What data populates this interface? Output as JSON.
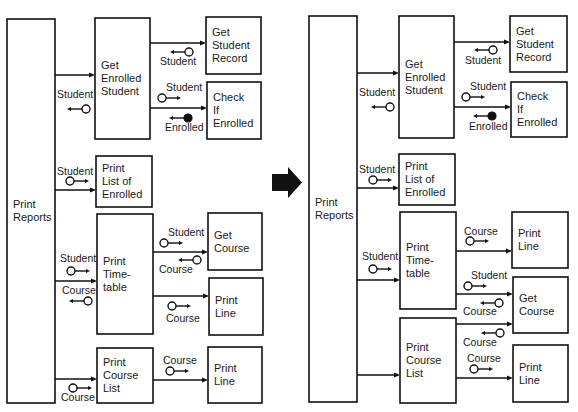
{
  "colors": {
    "ink": "#111111",
    "background": "#ffffff",
    "transform_arrow": "#111111"
  },
  "transform_arrow": {
    "icon": "right-arrow-icon",
    "meaning": "transforms-into"
  },
  "before": {
    "modules": [
      {
        "id": "print-reports",
        "lines": [
          "Print",
          "Reports"
        ],
        "x": 7,
        "y": 19,
        "w": 48,
        "h": 384
      },
      {
        "id": "get-enrolled-student",
        "lines": [
          "Get",
          "Enrolled",
          "Student"
        ],
        "x": 95,
        "y": 18,
        "w": 55,
        "h": 121
      },
      {
        "id": "get-student-record",
        "lines": [
          "Get",
          "Student",
          "Record"
        ],
        "x": 206,
        "y": 17,
        "w": 55,
        "h": 57
      },
      {
        "id": "check-if-enrolled",
        "lines": [
          "Check",
          "If",
          "Enrolled"
        ],
        "x": 207,
        "y": 82,
        "w": 54,
        "h": 57
      },
      {
        "id": "print-list-of-enrolled",
        "lines": [
          "Print",
          "List of",
          "Enrolled"
        ],
        "x": 96,
        "y": 156,
        "w": 56,
        "h": 51
      },
      {
        "id": "print-timetable",
        "lines": [
          "Print",
          "Time-",
          "table"
        ],
        "x": 97,
        "y": 214,
        "w": 56,
        "h": 120
      },
      {
        "id": "get-course",
        "lines": [
          "Get",
          "Course"
        ],
        "x": 208,
        "y": 213,
        "w": 54,
        "h": 57
      },
      {
        "id": "print-line-a",
        "lines": [
          "Print",
          "Line"
        ],
        "x": 209,
        "y": 278,
        "w": 54,
        "h": 57
      },
      {
        "id": "print-course-list",
        "lines": [
          "Print",
          "Course",
          "List"
        ],
        "x": 97,
        "y": 348,
        "w": 56,
        "h": 55
      },
      {
        "id": "print-line-b",
        "lines": [
          "Print",
          "Line"
        ],
        "x": 208,
        "y": 347,
        "w": 54,
        "h": 56
      }
    ],
    "calls": [
      {
        "from": "print-reports",
        "to": "get-enrolled-student",
        "y": 75
      },
      {
        "from": "get-enrolled-student",
        "to": "get-student-record",
        "y": 43
      },
      {
        "from": "get-enrolled-student",
        "to": "check-if-enrolled",
        "y": 108
      },
      {
        "from": "print-reports",
        "to": "print-list-of-enrolled",
        "y": 190
      },
      {
        "from": "print-reports",
        "to": "print-timetable",
        "y": 281
      },
      {
        "from": "print-timetable",
        "to": "get-course",
        "y": 252
      },
      {
        "from": "print-timetable",
        "to": "print-line-a",
        "y": 296
      },
      {
        "from": "print-reports",
        "to": "print-course-list",
        "y": 379
      },
      {
        "from": "print-course-list",
        "to": "print-line-b",
        "y": 380
      }
    ],
    "couples": [
      {
        "label": "Student",
        "kind": "data",
        "dir": "left",
        "cx": 86,
        "cy": 109,
        "lx": 57,
        "ly": 98
      },
      {
        "label": "Student",
        "kind": "data",
        "dir": "left",
        "cx": 189,
        "cy": 52,
        "lx": 160,
        "ly": 65
      },
      {
        "label": "Student",
        "kind": "data",
        "dir": "right",
        "cx": 162,
        "cy": 98,
        "lx": 166,
        "ly": 91
      },
      {
        "label": "Enrolled",
        "kind": "flag",
        "dir": "left",
        "cx": 188,
        "cy": 118,
        "lx": 165,
        "ly": 131
      },
      {
        "label": "Student",
        "kind": "data",
        "dir": "right",
        "cx": 70,
        "cy": 181,
        "lx": 57,
        "ly": 175
      },
      {
        "label": "Student",
        "kind": "data",
        "dir": "right",
        "cx": 71,
        "cy": 271,
        "lx": 60,
        "ly": 262
      },
      {
        "label": "Course",
        "kind": "data",
        "dir": "left",
        "cx": 88,
        "cy": 301,
        "lx": 62,
        "ly": 294
      },
      {
        "label": "Student",
        "kind": "data",
        "dir": "right",
        "cx": 164,
        "cy": 243,
        "lx": 168,
        "ly": 236
      },
      {
        "label": "Course",
        "kind": "data",
        "dir": "left",
        "cx": 197,
        "cy": 260,
        "lx": 159,
        "ly": 273
      },
      {
        "label": "Course",
        "kind": "data",
        "dir": "right",
        "cx": 172,
        "cy": 306,
        "lx": 166,
        "ly": 322
      },
      {
        "label": "Course",
        "kind": "data",
        "dir": "right",
        "cx": 170,
        "cy": 371,
        "lx": 163,
        "ly": 364
      },
      {
        "label": "Course",
        "kind": "data",
        "dir": "right",
        "cx": 73,
        "cy": 388,
        "lx": 61,
        "ly": 401
      }
    ]
  },
  "after": {
    "modules": [
      {
        "id": "print-reports",
        "lines": [
          "Print",
          "Reports"
        ],
        "x": 309,
        "y": 16,
        "w": 48,
        "h": 386
      },
      {
        "id": "get-enrolled-student",
        "lines": [
          "Get",
          "Enrolled",
          "Student"
        ],
        "x": 399,
        "y": 16,
        "w": 55,
        "h": 122
      },
      {
        "id": "get-student-record",
        "lines": [
          "Get",
          "Student",
          "Record"
        ],
        "x": 510,
        "y": 16,
        "w": 57,
        "h": 56
      },
      {
        "id": "check-if-enrolled",
        "lines": [
          "Check",
          "If",
          "Enrolled"
        ],
        "x": 511,
        "y": 82,
        "w": 56,
        "h": 55
      },
      {
        "id": "print-list-of-enrolled",
        "lines": [
          "Print",
          "List of",
          "Enrolled"
        ],
        "x": 399,
        "y": 154,
        "w": 56,
        "h": 51
      },
      {
        "id": "print-timetable",
        "lines": [
          "Print",
          "Time-",
          "table"
        ],
        "x": 400,
        "y": 212,
        "w": 56,
        "h": 97
      },
      {
        "id": "print-line-a",
        "lines": [
          "Print",
          "Line"
        ],
        "x": 512,
        "y": 212,
        "w": 56,
        "h": 56
      },
      {
        "id": "get-course",
        "lines": [
          "Get",
          "Course"
        ],
        "x": 513,
        "y": 277,
        "w": 55,
        "h": 56
      },
      {
        "id": "print-course-list",
        "lines": [
          "Print",
          "Course",
          "List"
        ],
        "x": 400,
        "y": 318,
        "w": 56,
        "h": 85
      },
      {
        "id": "print-line-b",
        "lines": [
          "Print",
          "Line"
        ],
        "x": 513,
        "y": 345,
        "w": 55,
        "h": 57
      }
    ],
    "calls": [
      {
        "from": "print-reports",
        "to": "get-enrolled-student",
        "y": 73
      },
      {
        "from": "get-enrolled-student",
        "to": "get-student-record",
        "y": 42
      },
      {
        "from": "get-enrolled-student",
        "to": "check-if-enrolled",
        "y": 107
      },
      {
        "from": "print-reports",
        "to": "print-list-of-enrolled",
        "y": 188
      },
      {
        "from": "print-reports",
        "to": "print-timetable",
        "y": 280
      },
      {
        "from": "print-timetable",
        "to": "print-line-a",
        "y": 251
      },
      {
        "from": "print-timetable",
        "to": "get-course",
        "y": 294
      },
      {
        "from": "print-course-list",
        "to": "get-course",
        "y": 324
      },
      {
        "from": "print-reports",
        "to": "print-course-list",
        "y": 375
      },
      {
        "from": "print-course-list",
        "to": "print-line-b",
        "y": 378
      }
    ],
    "couples": [
      {
        "label": "Student",
        "kind": "data",
        "dir": "left",
        "cx": 390,
        "cy": 107,
        "lx": 359,
        "ly": 96
      },
      {
        "label": "Student",
        "kind": "data",
        "dir": "left",
        "cx": 493,
        "cy": 50,
        "lx": 465,
        "ly": 64
      },
      {
        "label": "Student",
        "kind": "data",
        "dir": "right",
        "cx": 466,
        "cy": 97,
        "lx": 470,
        "ly": 90
      },
      {
        "label": "Enrolled",
        "kind": "flag",
        "dir": "left",
        "cx": 492,
        "cy": 116,
        "lx": 469,
        "ly": 130
      },
      {
        "label": "Student",
        "kind": "data",
        "dir": "right",
        "cx": 373,
        "cy": 180,
        "lx": 359,
        "ly": 173
      },
      {
        "label": "Student",
        "kind": "data",
        "dir": "right",
        "cx": 373,
        "cy": 269,
        "lx": 362,
        "ly": 260
      },
      {
        "label": "Course",
        "kind": "data",
        "dir": "right",
        "cx": 470,
        "cy": 241,
        "lx": 464,
        "ly": 235
      },
      {
        "label": "Student",
        "kind": "data",
        "dir": "right",
        "cx": 468,
        "cy": 286,
        "lx": 471,
        "ly": 279
      },
      {
        "label": "Course",
        "kind": "data",
        "dir": "left",
        "cx": 499,
        "cy": 303,
        "lx": 463,
        "ly": 315
      },
      {
        "label": "Course",
        "kind": "data",
        "dir": "left",
        "cx": 500,
        "cy": 333,
        "lx": 463,
        "ly": 346
      },
      {
        "label": "Course",
        "kind": "data",
        "dir": "right",
        "cx": 474,
        "cy": 369,
        "lx": 467,
        "ly": 362
      }
    ]
  }
}
